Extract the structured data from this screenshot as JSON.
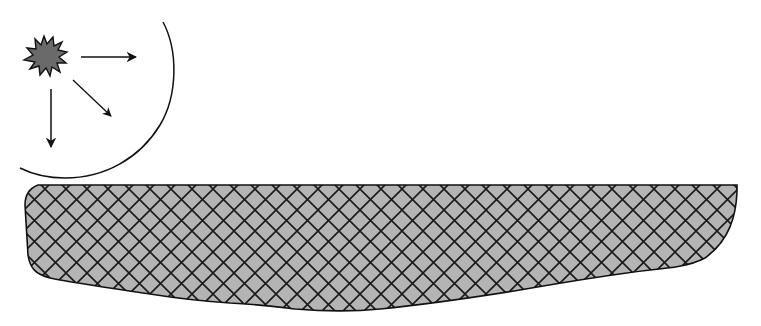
{
  "diagram": {
    "description": "Point source emitting in three directions, bounded by a circular wavefront, above a cross-hatched surface slab",
    "colors": {
      "background": "#ffffff",
      "stroke": "#111111",
      "source_fill": "#6a6a6a",
      "slab_fill": "#b4b4b4",
      "hatch": "#1a1a1a"
    },
    "source": {
      "shape": "splat",
      "cx": 44,
      "cy": 58,
      "label": "source"
    },
    "arrows": [
      {
        "name": "arrow-right",
        "x1": 81,
        "y1": 57,
        "x2": 138,
        "y2": 57
      },
      {
        "name": "arrow-diagonal",
        "x1": 73,
        "y1": 80,
        "x2": 112,
        "y2": 117
      },
      {
        "name": "arrow-down",
        "x1": 51,
        "y1": 89,
        "x2": 51,
        "y2": 149
      }
    ],
    "wavefront": {
      "shape": "circular-arc",
      "label": "wavefront"
    },
    "slab": {
      "pattern": "cross-hatch",
      "label": "surface"
    }
  }
}
